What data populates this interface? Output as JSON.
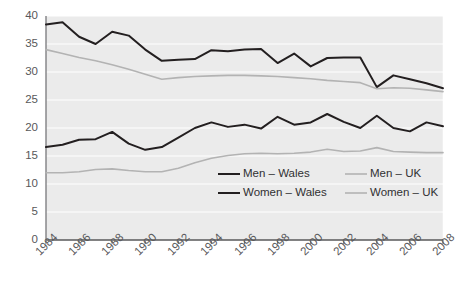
{
  "chart_data": {
    "type": "line",
    "title": "",
    "subtitle": "",
    "xlabel": "",
    "ylabel": "",
    "xlim": [
      1984,
      2008
    ],
    "ylim": [
      0,
      40
    ],
    "ytick_step": 5,
    "grid": true,
    "legend_position": "inside-center",
    "plot_background": "#f0f0f0",
    "x": [
      1984,
      1985,
      1986,
      1987,
      1988,
      1989,
      1990,
      1991,
      1992,
      1993,
      1994,
      1995,
      1996,
      1997,
      1998,
      1999,
      2000,
      2001,
      2002,
      2003,
      2004,
      2005,
      2006,
      2007,
      2008
    ],
    "xticks": [
      "1984",
      "1986",
      "1988",
      "1990",
      "1992",
      "1994",
      "1996",
      "1998",
      "2000",
      "2002",
      "2004",
      "2006",
      "2008"
    ],
    "yticks": [
      "0",
      "5",
      "10",
      "15",
      "20",
      "25",
      "30",
      "35",
      "40"
    ],
    "series": [
      {
        "name": "Men – Wales",
        "color": "#231f20",
        "width": 2.0,
        "values": [
          38.5,
          38.9,
          36.3,
          35.0,
          37.2,
          36.5,
          34.0,
          32.0,
          32.2,
          32.3,
          33.9,
          33.7,
          34.0,
          34.1,
          31.6,
          33.3,
          31.0,
          32.5,
          32.6,
          32.6,
          27.3,
          29.4,
          28.7,
          28.0,
          27.1
        ]
      },
      {
        "name": "Women – Wales",
        "color": "#231f20",
        "width": 2.0,
        "values": [
          16.6,
          17.0,
          17.9,
          18.0,
          19.3,
          17.2,
          16.1,
          16.6,
          18.3,
          20.0,
          21.0,
          20.2,
          20.6,
          19.9,
          22.0,
          20.6,
          21.0,
          22.5,
          21.1,
          20.0,
          22.2,
          20.0,
          19.4,
          21.0,
          20.3
        ]
      },
      {
        "name": "Men – UK",
        "color": "#b3b3b3",
        "width": 1.6,
        "values": [
          34.0,
          33.3,
          32.6,
          32.0,
          31.3,
          30.5,
          29.6,
          28.7,
          29.0,
          29.2,
          29.3,
          29.4,
          29.4,
          29.3,
          29.2,
          29.0,
          28.8,
          28.5,
          28.3,
          28.1,
          27.0,
          27.2,
          27.1,
          26.8,
          26.5
        ]
      },
      {
        "name": "Women – UK",
        "color": "#b3b3b3",
        "width": 1.6,
        "values": [
          12.0,
          12.0,
          12.2,
          12.6,
          12.7,
          12.4,
          12.2,
          12.2,
          12.8,
          13.8,
          14.6,
          15.1,
          15.4,
          15.5,
          15.4,
          15.5,
          15.7,
          16.2,
          15.8,
          15.9,
          16.5,
          15.8,
          15.7,
          15.6,
          15.6
        ]
      }
    ],
    "legend": [
      {
        "label": "Men – Wales",
        "color": "#231f20",
        "col": 0,
        "row": 0
      },
      {
        "label": "Women – Wales",
        "color": "#231f20",
        "col": 0,
        "row": 1
      },
      {
        "label": "Men – UK",
        "color": "#b3b3b3",
        "col": 1,
        "row": 0
      },
      {
        "label": "Women – UK",
        "color": "#b3b3b3",
        "col": 1,
        "row": 1
      }
    ]
  }
}
